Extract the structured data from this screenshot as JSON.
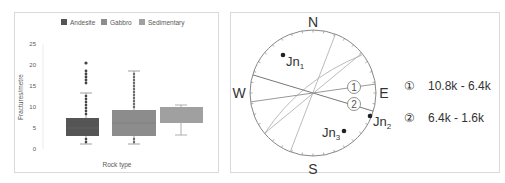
{
  "chart_data": [
    {
      "type": "box",
      "title": "",
      "xlabel": "Rock type",
      "ylabel": "Fractures/metre",
      "ylim": [
        0,
        25
      ],
      "yticks": [
        0,
        5,
        10,
        15,
        20,
        25
      ],
      "grid": false,
      "legend_position": "top",
      "legend": [
        "Andesite",
        "Gabbro",
        "Sedimentary"
      ],
      "series": [
        {
          "name": "Andesite",
          "color": "#555555",
          "min": 1.2,
          "q1": 3.0,
          "median": 5.0,
          "q3": 7.4,
          "max": 13.3,
          "outliers": [
            14,
            15,
            16,
            17,
            18,
            20
          ]
        },
        {
          "name": "Gabbro",
          "color": "#8c8c8c",
          "min": 1.2,
          "q1": 3.0,
          "median": 6.2,
          "q3": 9.4,
          "max": 18.3,
          "outliers": []
        },
        {
          "name": "Sedimentary",
          "color": "#a0a0a0",
          "min": 3.3,
          "q1": 6.2,
          "median": 9.0,
          "q3": 10.0,
          "max": 10.3,
          "outliers": []
        }
      ]
    },
    {
      "type": "stereonet",
      "compass": {
        "N": "N",
        "E": "E",
        "S": "S",
        "W": "W"
      },
      "points": [
        {
          "label": "Jn",
          "sub": "1"
        },
        {
          "label": "Jn",
          "sub": "2"
        },
        {
          "label": "Jn",
          "sub": "3"
        }
      ],
      "legend": [
        {
          "marker": "①",
          "text": "10.8k - 6.4k"
        },
        {
          "marker": "②",
          "text": "6.4k - 1.6k"
        }
      ]
    }
  ],
  "box": {
    "legend": [
      "Andesite",
      "Gabbro",
      "Sedimentary"
    ],
    "yticks": [
      "25",
      "20",
      "15",
      "10",
      "5",
      "0"
    ],
    "ylabel": "Fractures/metre",
    "xlabel": "Rock type"
  },
  "stereo": {
    "N": "N",
    "E": "E",
    "S": "S",
    "W": "W",
    "jn": "Jn",
    "jn1": "1",
    "jn2": "2",
    "jn3": "3",
    "m1": "1",
    "m2": "2",
    "leg1_marker": "①",
    "leg1_text": "10.8k - 6.4k",
    "leg2_marker": "②",
    "leg2_text": "6.4k - 1.6k"
  }
}
